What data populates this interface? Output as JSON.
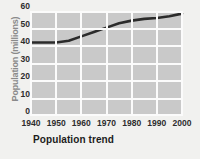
{
  "chart_data": {
    "type": "line",
    "title": "Population trend",
    "xlabel": "",
    "ylabel": "Population (millions)",
    "x": [
      1940,
      1945,
      1950,
      1955,
      1960,
      1965,
      1970,
      1975,
      1980,
      1985,
      1990,
      1995,
      2000
    ],
    "values": [
      42,
      42,
      42,
      43,
      45.5,
      48,
      50.5,
      53,
      54.5,
      55.5,
      56,
      57,
      58.5
    ],
    "series": [
      {
        "name": "Population",
        "values": [
          42,
          42,
          42,
          43,
          45.5,
          48,
          50.5,
          53,
          54.5,
          55.5,
          56,
          57,
          58.5
        ]
      }
    ],
    "xlim": [
      1940,
      2000
    ],
    "ylim": [
      0,
      60
    ],
    "xticks": [
      "1940",
      "1950",
      "1960",
      "1970",
      "1980",
      "1990",
      "2000"
    ],
    "yticks": [
      "0",
      "10",
      "20",
      "30",
      "40",
      "50",
      "60"
    ],
    "grid": true,
    "legend": "none",
    "colors": {
      "line": "#2b2b2b",
      "plot_background": "#c9c9c9",
      "gridline": "#fbfbfb",
      "page_background": "#f1f1ef",
      "tick_text": "#2d2d2d",
      "axis_title": "#8a8a8a"
    }
  }
}
